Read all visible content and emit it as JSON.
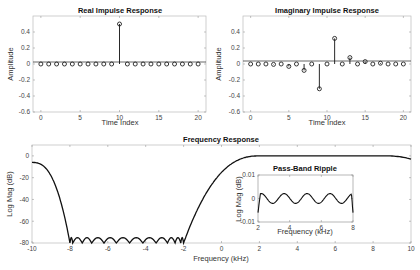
{
  "chart_data": [
    {
      "type": "stem",
      "title": "Real Impulse Response",
      "xlabel": "Time Index",
      "ylabel": "Amplitude",
      "xlim": [
        -1,
        21
      ],
      "ylim": [
        -0.6,
        0.6
      ],
      "xticks": [
        0,
        5,
        10,
        15,
        20
      ],
      "yticks": [
        -0.6,
        -0.4,
        -0.2,
        0,
        0.2,
        0.4
      ],
      "x": [
        0,
        1,
        2,
        3,
        4,
        5,
        6,
        7,
        8,
        9,
        10,
        11,
        12,
        13,
        14,
        15,
        16,
        17,
        18,
        19,
        20
      ],
      "values": [
        0,
        0,
        0,
        0,
        0,
        0,
        0,
        0,
        0,
        0,
        0.5,
        0,
        0,
        0,
        0,
        0,
        0,
        0,
        0,
        0,
        0
      ]
    },
    {
      "type": "stem",
      "title": "Imaginary Impulse Response",
      "xlabel": "Time Index",
      "ylabel": "Amplitude",
      "xlim": [
        -1,
        21
      ],
      "ylim": [
        -0.6,
        0.6
      ],
      "xticks": [
        0,
        5,
        10,
        15,
        20
      ],
      "yticks": [
        -0.6,
        -0.4,
        -0.2,
        0,
        0.2,
        0.4
      ],
      "x": [
        0,
        1,
        2,
        3,
        4,
        5,
        6,
        7,
        8,
        9,
        10,
        11,
        12,
        13,
        14,
        15,
        16,
        17,
        18,
        19,
        20
      ],
      "values": [
        0,
        0,
        0,
        -0.005,
        0,
        -0.03,
        0,
        -0.08,
        0,
        -0.31,
        0,
        0.32,
        0,
        0.08,
        0,
        0.03,
        0,
        0.01,
        0,
        0,
        0
      ]
    },
    {
      "type": "line",
      "title": "Frequency Response",
      "xlabel": "Frequency (kHz)",
      "ylabel": "Log Mag (dB)",
      "xlim": [
        -10,
        10
      ],
      "ylim": [
        -80,
        10
      ],
      "xticks": [
        -10,
        -8,
        -6,
        -4,
        -2,
        0,
        2,
        4,
        6,
        8,
        10
      ],
      "yticks": [
        -80,
        -60,
        -40,
        -20,
        0
      ],
      "description": "Stopband from -8 to -2 kHz with equiripple lobes near -75 dB; passband 0 to ~9 kHz near 0 dB; rolloff at edges",
      "points": [
        [
          -10,
          -6
        ],
        [
          -9.5,
          -12
        ],
        [
          -9,
          -22
        ],
        [
          -8.5,
          -40
        ],
        [
          -8.1,
          -70
        ],
        [
          -8,
          -80
        ],
        [
          -2,
          -80
        ],
        [
          -1.9,
          -70
        ],
        [
          -1.5,
          -38
        ],
        [
          -1,
          -20
        ],
        [
          -0.5,
          -10
        ],
        [
          0,
          -4
        ],
        [
          0.5,
          -1.5
        ],
        [
          1,
          -0.5
        ],
        [
          2,
          0
        ],
        [
          8,
          0
        ],
        [
          9,
          -0.5
        ],
        [
          9.5,
          -1.5
        ],
        [
          10,
          -3
        ]
      ]
    },
    {
      "type": "line",
      "title": "Pass-Band Ripple",
      "xlabel": "Frequency (kHz)",
      "ylabel": "Log Mag (dB)",
      "xlim": [
        2,
        8
      ],
      "ylim": [
        -0.01,
        0.01
      ],
      "xticks": [
        2,
        4,
        6,
        8
      ],
      "yticks": [
        -0.01,
        0,
        0.01
      ],
      "description": "Equiripple oscillation of about ±0.002 dB between 2 and 8 kHz, dropping at both edges"
    }
  ],
  "texts": {
    "p1_title": "Real Impulse Response",
    "p2_title": "Imaginary Impulse Response",
    "p3_title": "Frequency Response",
    "p4_title": "Pass-Band Ripple",
    "time_label": "Time Index",
    "amp_label": "Amplitude",
    "freq_label": "Frequency (kHz)",
    "mag_label": "Log Mag (dB)"
  }
}
